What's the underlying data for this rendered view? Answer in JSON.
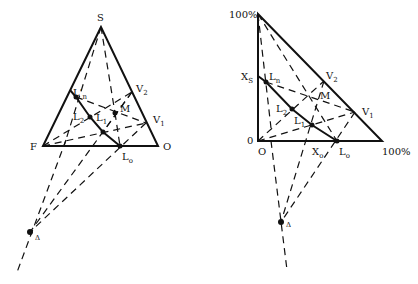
{
  "left_diagram": {
    "labels": {
      "apex": "S",
      "left_vertex": "F",
      "right_vertex": "O",
      "Ln_prime": "L'",
      "Ln_prime_sub": "n",
      "L2": "L",
      "L2_sub": "2",
      "L1": "L",
      "L1_sub": "1",
      "Lo": "L",
      "Lo_sub": "o",
      "M": "M",
      "V2": "V",
      "V2_sub": "2",
      "V1": "V",
      "V1_sub": "1",
      "delta": "Δ"
    }
  },
  "right_diagram": {
    "labels": {
      "top": "100%",
      "origin_y": "0",
      "origin_x": "O",
      "right": "100%",
      "Xs": "X",
      "Xs_sub": "S",
      "Xo": "X",
      "Xo_sub": "o",
      "Ln": "L",
      "Ln_sub": "n",
      "L2": "L",
      "L2_sub": "2",
      "L1": "L",
      "L1_sub": "1",
      "Lo": "L",
      "Lo_sub": "o",
      "M": "M",
      "V2": "V",
      "V2_sub": "2",
      "V1": "V",
      "V1_sub": "1",
      "delta": "Δ"
    }
  }
}
